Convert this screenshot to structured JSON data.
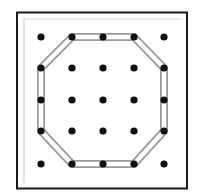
{
  "diagram": {
    "type": "geoboard",
    "grid": {
      "rows": 5,
      "cols": 5
    },
    "peg_x": [
      41,
      72,
      103,
      134,
      164
    ],
    "peg_y": [
      37,
      68,
      100,
      131,
      164
    ],
    "band_shape": "octagon",
    "band_vertices_grid": [
      [
        1,
        0
      ],
      [
        3,
        0
      ],
      [
        4,
        1
      ],
      [
        4,
        3
      ],
      [
        3,
        4
      ],
      [
        1,
        4
      ],
      [
        0,
        3
      ],
      [
        0,
        1
      ]
    ],
    "colors": {
      "board_border": "#1a1a1a",
      "inner_border": "#cfcfcf",
      "peg": "#111111",
      "band_outline": "#9a9a9a",
      "band_fill": "#ffffff"
    }
  }
}
